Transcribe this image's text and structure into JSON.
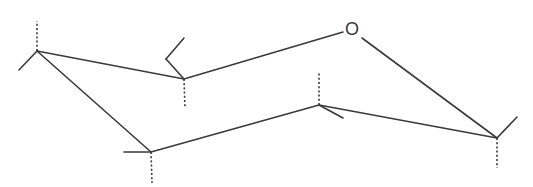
{
  "diagram": {
    "type": "chair-conformation",
    "atom_labels": [
      {
        "id": "ring-oxygen",
        "text": "O",
        "x": 352,
        "y": 30
      }
    ],
    "ring_bonds": [
      {
        "from": [
          37,
          51
        ],
        "to": [
          184,
          79
        ]
      },
      {
        "from": [
          184,
          79
        ],
        "to": [
          343,
          32
        ]
      },
      {
        "from": [
          362,
          38
        ],
        "to": [
          497,
          138
        ]
      },
      {
        "from": [
          497,
          138
        ],
        "to": [
          319,
          105
        ]
      },
      {
        "from": [
          319,
          105
        ],
        "to": [
          151,
          152
        ]
      },
      {
        "from": [
          151,
          152
        ],
        "to": [
          37,
          51
        ]
      }
    ],
    "substituent_bonds": [
      {
        "from": [
          37,
          51
        ],
        "to": [
          19,
          70
        ]
      },
      {
        "from": [
          184,
          79
        ],
        "to": [
          166,
          59
        ]
      },
      {
        "from": [
          166,
          59
        ],
        "to": [
          184,
          38
        ]
      },
      {
        "from": [
          151,
          152
        ],
        "to": [
          124,
          152
        ]
      },
      {
        "from": [
          319,
          105
        ],
        "to": [
          343,
          118
        ]
      },
      {
        "from": [
          497,
          138
        ],
        "to": [
          517,
          117
        ]
      }
    ],
    "hashed_bonds": [
      {
        "from": [
          37,
          51
        ],
        "to": [
          37,
          21
        ]
      },
      {
        "from": [
          184,
          79
        ],
        "to": [
          185,
          108
        ]
      },
      {
        "from": [
          151,
          152
        ],
        "to": [
          152,
          183
        ]
      },
      {
        "from": [
          319,
          105
        ],
        "to": [
          319,
          73
        ]
      },
      {
        "from": [
          497,
          138
        ],
        "to": [
          497,
          168
        ]
      }
    ]
  }
}
